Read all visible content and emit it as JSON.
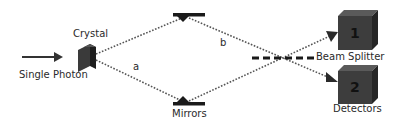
{
  "labels": {
    "source": "Single Photon",
    "crystal": "Crystal",
    "mirrors": "Mirrors",
    "path_a": "a",
    "path_b": "b",
    "beam_splitter": "Beam Splitter",
    "detectors": "Detectors"
  },
  "detectors": [
    {
      "number": "1"
    },
    {
      "number": "2"
    }
  ],
  "colors": {
    "ink": "#2a2a2a",
    "crystal_face": "#3a3a3a",
    "crystal_side": "#1e1e1e",
    "detector_front": "#3d3d3d",
    "detector_top": "#5a5a5a",
    "detector_side": "#262626",
    "path": "#555555"
  }
}
